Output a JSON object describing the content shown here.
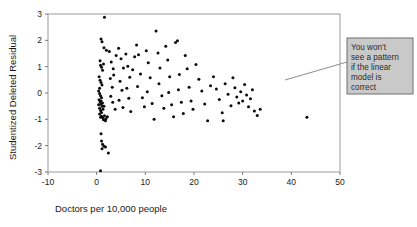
{
  "chart_data": {
    "type": "scatter",
    "title": "",
    "xlabel": "Doctors per 10,000 people",
    "ylabel": "Studentized Deleted Residual",
    "xlim": [
      -10,
      50
    ],
    "ylim": [
      -3,
      3
    ],
    "xticks": [
      -10,
      0,
      10,
      20,
      30,
      40,
      50
    ],
    "yticks": [
      -3,
      -2,
      -1,
      0,
      1,
      2,
      3
    ],
    "xtick_labels": [
      "-10",
      "0",
      "10",
      "20",
      "30",
      "40",
      "50"
    ],
    "ytick_labels": [
      "-3",
      "-2",
      "-1",
      "0",
      "1",
      "2",
      "3"
    ],
    "grid": false,
    "legend": null,
    "marker": "filled-circle",
    "marker_color": "#0b0b0b",
    "points": [
      [
        1.6,
        2.88
      ],
      [
        0.9,
        2.05
      ],
      [
        1.1,
        1.95
      ],
      [
        1.5,
        1.72
      ],
      [
        2.0,
        1.62
      ],
      [
        0.7,
        1.22
      ],
      [
        0.8,
        1.05
      ],
      [
        1.0,
        0.98
      ],
      [
        1.2,
        0.86
      ],
      [
        1.4,
        1.1
      ],
      [
        0.5,
        0.62
      ],
      [
        0.7,
        0.48
      ],
      [
        0.9,
        0.4
      ],
      [
        1.1,
        0.3
      ],
      [
        0.6,
        0.18
      ],
      [
        0.4,
        0.08
      ],
      [
        0.6,
        -0.02
      ],
      [
        0.8,
        -0.1
      ],
      [
        1.0,
        -0.18
      ],
      [
        0.5,
        -0.26
      ],
      [
        0.7,
        -0.34
      ],
      [
        0.9,
        -0.42
      ],
      [
        1.1,
        -0.5
      ],
      [
        0.6,
        -0.58
      ],
      [
        0.8,
        -0.66
      ],
      [
        1.0,
        -0.74
      ],
      [
        1.3,
        -0.62
      ],
      [
        1.5,
        -0.5
      ],
      [
        1.2,
        -0.38
      ],
      [
        0.9,
        -0.3
      ],
      [
        0.4,
        -0.45
      ],
      [
        0.6,
        -0.8
      ],
      [
        0.8,
        -0.92
      ],
      [
        1.0,
        -0.88
      ],
      [
        1.3,
        -0.95
      ],
      [
        1.6,
        -0.86
      ],
      [
        1.9,
        -0.98
      ],
      [
        2.2,
        -0.9
      ],
      [
        1.4,
        -1.02
      ],
      [
        1.8,
        -1.05
      ],
      [
        0.9,
        -1.55
      ],
      [
        1.0,
        -1.82
      ],
      [
        1.2,
        -1.95
      ],
      [
        1.5,
        -2.02
      ],
      [
        1.1,
        -2.12
      ],
      [
        1.8,
        -2.05
      ],
      [
        2.4,
        -2.28
      ],
      [
        0.8,
        -2.95
      ],
      [
        2.6,
        1.58
      ],
      [
        3.0,
        1.18
      ],
      [
        3.4,
        0.92
      ],
      [
        2.8,
        0.55
      ],
      [
        3.2,
        0.22
      ],
      [
        2.9,
        -0.12
      ],
      [
        3.3,
        -0.35
      ],
      [
        3.8,
        -0.62
      ],
      [
        3.5,
        0.68
      ],
      [
        4.0,
        1.42
      ],
      [
        4.5,
        1.7
      ],
      [
        5.0,
        1.3
      ],
      [
        5.5,
        0.95
      ],
      [
        4.8,
        0.45
      ],
      [
        5.2,
        0.1
      ],
      [
        4.6,
        -0.28
      ],
      [
        5.4,
        -0.55
      ],
      [
        6.0,
        1.48
      ],
      [
        6.4,
        1.02
      ],
      [
        6.8,
        0.6
      ],
      [
        6.2,
        0.18
      ],
      [
        6.6,
        -0.2
      ],
      [
        7.0,
        -0.7
      ],
      [
        7.4,
        0.88
      ],
      [
        7.8,
        1.38
      ],
      [
        8.2,
        1.82
      ],
      [
        8.6,
        1.45
      ],
      [
        9.0,
        0.72
      ],
      [
        8.4,
        0.25
      ],
      [
        9.4,
        -0.18
      ],
      [
        9.8,
        -0.52
      ],
      [
        10.2,
        1.6
      ],
      [
        10.6,
        1.15
      ],
      [
        11.0,
        0.58
      ],
      [
        10.4,
        0.05
      ],
      [
        11.4,
        -0.4
      ],
      [
        11.8,
        -1.0
      ],
      [
        12.2,
        2.35
      ],
      [
        12.6,
        1.52
      ],
      [
        13.0,
        0.95
      ],
      [
        12.8,
        0.35
      ],
      [
        13.4,
        -0.1
      ],
      [
        13.8,
        -0.58
      ],
      [
        14.2,
        1.78
      ],
      [
        14.6,
        1.25
      ],
      [
        15.0,
        0.62
      ],
      [
        14.8,
        0.02
      ],
      [
        15.4,
        -0.45
      ],
      [
        15.8,
        -0.9
      ],
      [
        16.2,
        1.92
      ],
      [
        16.6,
        1.98
      ],
      [
        17.0,
        0.7
      ],
      [
        16.8,
        0.12
      ],
      [
        17.4,
        -0.35
      ],
      [
        17.8,
        -0.78
      ],
      [
        18.2,
        1.42
      ],
      [
        18.6,
        0.92
      ],
      [
        19.0,
        0.22
      ],
      [
        19.4,
        -0.3
      ],
      [
        19.8,
        -0.62
      ],
      [
        20.4,
        1.08
      ],
      [
        21.0,
        0.52
      ],
      [
        21.6,
        0.08
      ],
      [
        22.2,
        -0.42
      ],
      [
        22.8,
        -1.05
      ],
      [
        23.4,
        0.28
      ],
      [
        24.0,
        0.62
      ],
      [
        24.6,
        0.15
      ],
      [
        25.2,
        -0.25
      ],
      [
        25.8,
        -0.75
      ],
      [
        26.4,
        0.35
      ],
      [
        27.0,
        -0.05
      ],
      [
        27.6,
        -0.48
      ],
      [
        28.0,
        0.58
      ],
      [
        28.4,
        0.2
      ],
      [
        28.8,
        -0.15
      ],
      [
        29.2,
        -0.38
      ],
      [
        29.6,
        0.05
      ],
      [
        30.0,
        -0.3
      ],
      [
        30.4,
        0.32
      ],
      [
        30.8,
        -0.08
      ],
      [
        31.2,
        -0.52
      ],
      [
        31.6,
        -0.22
      ],
      [
        32.0,
        0.12
      ],
      [
        32.4,
        -0.68
      ],
      [
        33.0,
        -0.85
      ],
      [
        26.0,
        -1.05
      ],
      [
        33.6,
        -0.62
      ],
      [
        43.2,
        -0.92
      ]
    ]
  },
  "callout": {
    "lines": [
      "You won't",
      "see a pattern",
      "if the linear",
      "model is",
      "correct"
    ],
    "background": "#c9c9c9",
    "border": "#6f6f6f",
    "leader_from": [
      285,
      80
    ],
    "leader_to": [
      347,
      62
    ]
  }
}
